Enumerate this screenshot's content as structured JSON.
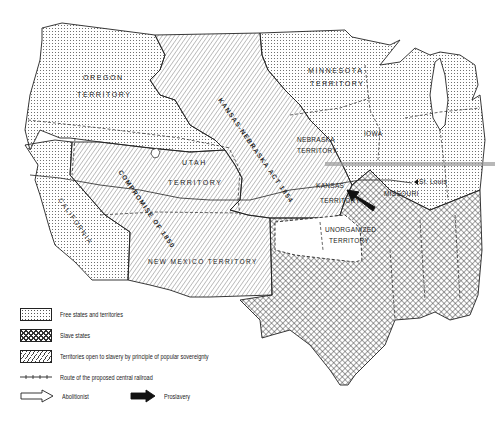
{
  "map": {
    "title": "Kansas-Nebraska Act 1854 territorial map",
    "region_labels": {
      "oregon_1": "OREGON",
      "oregon_2": "TERRITORY",
      "minnesota_1": "MINNESOTA",
      "minnesota_2": "TERRITORY",
      "iowa": "IOWA",
      "nebraska_1": "NEBRASKA",
      "nebraska_2": "TERRITORY",
      "kansas_1": "KANSAS",
      "kansas_2": "TERRITORY",
      "missouri": "MISSOURI",
      "st_louis": "St. Louis",
      "utah_1": "UTAH",
      "utah_2": "TERRITORY",
      "california": "CALIFORNIA",
      "new_mexico": "NEW MEXICO  TERRITORY",
      "unorganized_1": "UNORGANIZED",
      "unorganized_2": "TERRITORY"
    },
    "annotations": {
      "kansas_nebraska_act": "KANSAS-NEBRASKA ACT 1854",
      "compromise_1850": "COMPROMISE OF 1850"
    },
    "colors": {
      "ink": "#222222",
      "background": "#ffffff",
      "railroad_highlight": "#9a9a9a"
    }
  },
  "legend": {
    "items": [
      {
        "key": "free",
        "label": "Free states and territories"
      },
      {
        "key": "slave",
        "label": "Slave states"
      },
      {
        "key": "popular_sovereignty",
        "label": "Territories open to slavery by principle of popular sovereignty"
      },
      {
        "key": "railroad",
        "label": "Route of the proposed central railroad"
      },
      {
        "key": "abolitionist",
        "label": "Abolitionist"
      },
      {
        "key": "proslavery",
        "label": "Proslavery"
      }
    ]
  }
}
